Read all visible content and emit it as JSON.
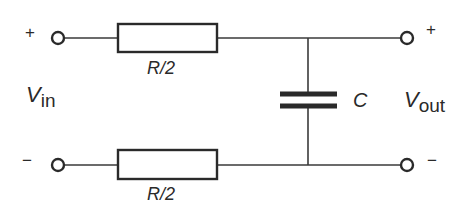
{
  "diagram": {
    "type": "circuit-schematic",
    "input": {
      "label_main": "V",
      "label_sub": "in",
      "plus_sign": "+",
      "minus_sign": "−"
    },
    "output": {
      "label_main": "V",
      "label_sub": "out",
      "plus_sign": "+",
      "minus_sign": "−"
    },
    "components": {
      "resistor_top": {
        "label": "R/2"
      },
      "resistor_bottom": {
        "label": "R/2"
      },
      "capacitor": {
        "label": "C"
      }
    },
    "colors": {
      "line": "#2a2a2a",
      "background": "#ffffff"
    }
  }
}
